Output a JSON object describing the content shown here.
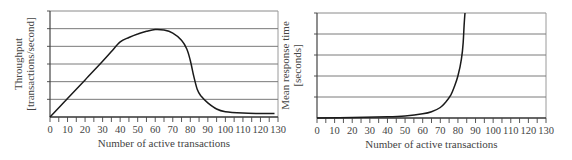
{
  "chart_data": [
    {
      "type": "line",
      "title": "",
      "xlabel": "Number of active transactions",
      "ylabel": "Throughput [transactions/second]",
      "ylabel_lines": [
        "Throughput",
        "[transactions/second]"
      ],
      "x_ticks": [
        0,
        10,
        20,
        30,
        40,
        50,
        60,
        70,
        80,
        90,
        100,
        110,
        120,
        130
      ],
      "xlim": [
        0,
        130
      ],
      "ylim": [
        0,
        6
      ],
      "y_gridlines": 6,
      "y_tick_labels": [],
      "grid": true,
      "legend": null,
      "series": [
        {
          "name": "Throughput",
          "x": [
            0,
            10,
            20,
            30,
            35,
            40,
            45,
            50,
            55,
            60,
            65,
            70,
            75,
            78,
            80,
            82,
            84,
            86,
            90,
            95,
            100,
            110,
            120,
            128
          ],
          "y": [
            0,
            1.05,
            2.1,
            3.15,
            3.7,
            4.25,
            4.5,
            4.7,
            4.85,
            4.95,
            4.92,
            4.75,
            4.35,
            3.85,
            3.2,
            2.3,
            1.55,
            1.2,
            0.8,
            0.45,
            0.3,
            0.22,
            0.2,
            0.2
          ]
        }
      ]
    },
    {
      "type": "line",
      "title": "",
      "xlabel": "Number of active transactions",
      "ylabel": "Mean response time [seconds]",
      "ylabel_lines": [
        "Mean response time",
        "[seconds]"
      ],
      "x_ticks": [
        0,
        10,
        20,
        30,
        40,
        50,
        60,
        70,
        80,
        90,
        100,
        110,
        120,
        130
      ],
      "xlim": [
        0,
        130
      ],
      "ylim": [
        0,
        5
      ],
      "y_gridlines": 5,
      "y_tick_labels": [],
      "grid": true,
      "legend": null,
      "series": [
        {
          "name": "Mean response time",
          "x": [
            0,
            20,
            40,
            50,
            60,
            65,
            70,
            73,
            76,
            78,
            80,
            82,
            83,
            83.5,
            84
          ],
          "y": [
            0,
            0.02,
            0.06,
            0.1,
            0.2,
            0.3,
            0.5,
            0.75,
            1.1,
            1.5,
            2.0,
            2.8,
            3.6,
            4.4,
            5.0
          ]
        }
      ]
    }
  ],
  "charts": {
    "left": {
      "xlabel": "Number of active transactions",
      "ylabel_1": "Throughput",
      "ylabel_2": "[transactions/second]"
    },
    "right": {
      "xlabel": "Number of active transactions",
      "ylabel_1": "Mean response time",
      "ylabel_2": "[seconds]"
    }
  }
}
